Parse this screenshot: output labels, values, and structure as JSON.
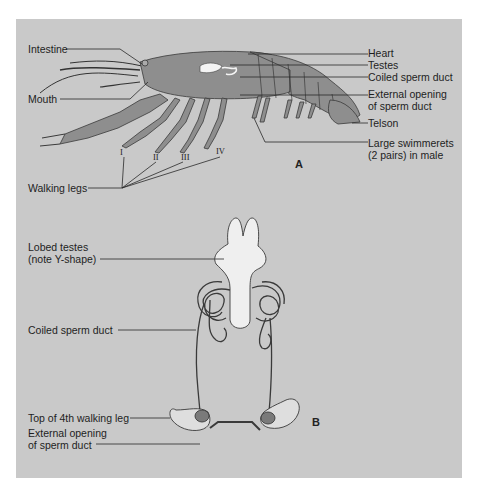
{
  "figure_a": {
    "panel_label": "A",
    "labels_left": {
      "intestine": "Intestine",
      "mouth": "Mouth",
      "walking_legs": "Walking legs"
    },
    "labels_right": {
      "heart": "Heart",
      "testes": "Testes",
      "coiled_sperm_duct": "Coiled sperm duct",
      "external_opening_line1": "External opening",
      "external_opening_line2": "of sperm duct",
      "telson": "Telson",
      "swimmerets_line1": "Large swimmerets",
      "swimmerets_line2": "(2 pairs) in male"
    },
    "leg_numbers": [
      "I",
      "II",
      "III",
      "IV"
    ]
  },
  "figure_b": {
    "panel_label": "B",
    "labels": {
      "lobed_testes_line1": "Lobed testes",
      "lobed_testes_line2": "(note Y-shape)",
      "coiled_sperm_duct": "Coiled sperm duct",
      "top_4th_leg": "Top of 4th walking leg",
      "external_opening_line1": "External opening",
      "external_opening_line2": "of sperm duct"
    }
  },
  "colors": {
    "panel_bg": "#c9c9c9",
    "body_fill": "#8e8e8e",
    "body_outline": "#3a3a3a",
    "testes_fill": "#efefef",
    "line": "#2a2a2a"
  }
}
